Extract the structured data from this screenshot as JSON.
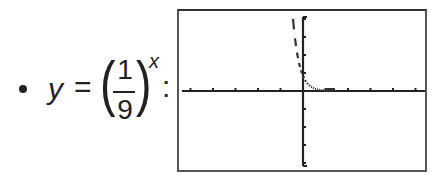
{
  "bullet": "•",
  "formula": {
    "lhs": "y",
    "equals": "=",
    "open_paren": "(",
    "numerator": "1",
    "denominator": "9",
    "close_paren": ")",
    "exponent": "x",
    "colon": ":"
  },
  "graph": {
    "description": "Graphing calculator window showing y = (1/9)^x",
    "frame_color": "#444444",
    "axis_color": "#222222",
    "curve_color": "#333333",
    "x_ticks_left": 7,
    "x_ticks_right": 7,
    "y_ticks_up": 5,
    "y_ticks_down": 5
  },
  "chart_data": {
    "type": "line",
    "xlabel": "",
    "ylabel": "",
    "xlim": [
      -5,
      5
    ],
    "ylim": [
      -5,
      5
    ],
    "grid": false,
    "series": [
      {
        "name": "y = (1/9)^x",
        "x": [
          -0.8,
          -0.6,
          -0.4,
          -0.2,
          0,
          0.2,
          0.4,
          0.6,
          0.8,
          1.0,
          1.5,
          2.0
        ],
        "values": [
          5.8,
          3.74,
          2.41,
          1.55,
          1,
          0.64,
          0.42,
          0.27,
          0.17,
          0.11,
          0.04,
          0.01
        ]
      }
    ]
  }
}
